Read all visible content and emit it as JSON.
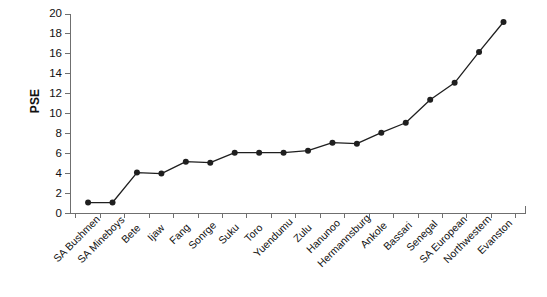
{
  "chart_data": {
    "type": "line",
    "title": "",
    "xlabel": "",
    "ylabel": "PSE",
    "ylim": [
      0,
      20
    ],
    "y_ticks": [
      0,
      2,
      4,
      6,
      8,
      10,
      12,
      14,
      16,
      18,
      20
    ],
    "grid": false,
    "legend": "none",
    "marker": "filled-circle",
    "categories": [
      "SA Bushmen",
      "SA Mineboys",
      "Bete",
      "Ijaw",
      "Fang",
      "Sonrge",
      "Suku",
      "Toro",
      "Yuendumu",
      "Zulu",
      "Hanunoo",
      "Hermannsburg",
      "Ankole",
      "Bassari",
      "Senegal",
      "SA European",
      "Northwestern",
      "Evanston"
    ],
    "values": [
      1.1,
      1.1,
      4.1,
      4.0,
      5.2,
      5.1,
      6.1,
      6.1,
      6.1,
      6.3,
      7.1,
      7.0,
      8.1,
      9.1,
      11.4,
      13.1,
      16.2,
      19.2
    ],
    "series": [
      {
        "name": "PSE",
        "values": [
          1.1,
          1.1,
          4.1,
          4.0,
          5.2,
          5.1,
          6.1,
          6.1,
          6.1,
          6.3,
          7.1,
          7.0,
          8.1,
          9.1,
          11.4,
          13.1,
          16.2,
          19.2
        ]
      }
    ],
    "line_color": "#1f1f1f",
    "marker_color": "#1f1f1f",
    "axis_color": "#6f6f6f"
  }
}
